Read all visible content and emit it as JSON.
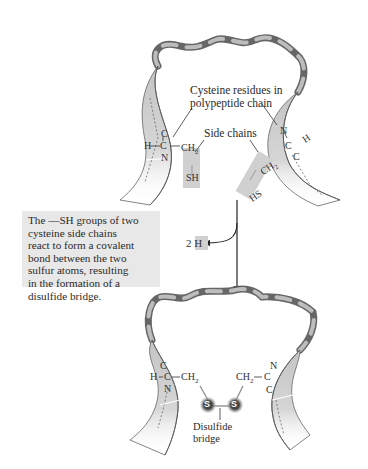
{
  "figure": {
    "type": "diagram",
    "top_panel": {
      "label_cysteine": [
        "Cysteine residues in",
        "polypeptide chain"
      ],
      "label_side_chains": "Side chains",
      "left_residue": {
        "h": "H",
        "c_alpha": "C",
        "c_top": "C",
        "n": "N",
        "side_chain_ch2": "CH2",
        "ch2_display": "CH",
        "ch2_sub": "2",
        "sh": "SH"
      },
      "right_residue": {
        "h": "H",
        "c_alpha": "C",
        "n": "N",
        "c_bottom": "C",
        "side_chain_ch2": "CH2",
        "ch2_display": "CH",
        "ch2_sub": "2",
        "hs": "HS"
      }
    },
    "reaction": {
      "released": "2 H",
      "released_coef": "2",
      "released_atom": "H"
    },
    "caption": [
      "The —SH groups of two",
      "cysteine side chains",
      "react to form a covalent",
      "bond between the two",
      "sulfur atoms, resulting",
      "in the formation of a",
      "disulfide bridge."
    ],
    "bottom_panel": {
      "left_residue": {
        "h": "H",
        "c_alpha": "C",
        "c_top": "C",
        "n": "N",
        "ch2_display": "CH",
        "ch2_sub": "2"
      },
      "right_residue": {
        "c_alpha": "C",
        "n": "N",
        "c_bottom": "C",
        "ch2_display": "CH",
        "ch2_sub": "2"
      },
      "sulfur_left": "S",
      "sulfur_right": "S",
      "label_bridge": [
        "Disulfide",
        "bridge"
      ]
    },
    "colors": {
      "ribbon_light": "#c8c8c8",
      "ribbon_dark": "#7a7a7a",
      "ribbon_edge": "#555555",
      "highlight_box": "#d0d0d0",
      "caption_bg": "#e8e8e8",
      "sulfur": "#3a3a3a",
      "sulfur_glow": "#bdbdbd",
      "text": "#2a2a2a"
    }
  }
}
